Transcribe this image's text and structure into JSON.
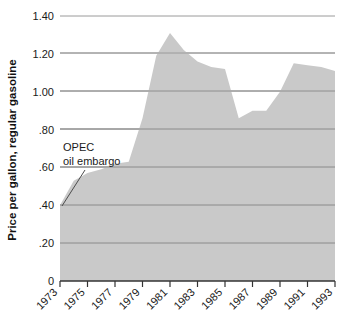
{
  "chart_data": {
    "type": "area",
    "title": "",
    "subtitle": "",
    "xlabel": "",
    "ylabel": "Price per gallon, regular gasoline",
    "xlim": [
      1973,
      1993
    ],
    "ylim": [
      0,
      1.4
    ],
    "grid": true,
    "legend": "none",
    "fill_color": "#c9c9c9",
    "grid_color": "#8c8c8c",
    "axis_color": "#333333",
    "x": [
      1973,
      1974,
      1975,
      1976,
      1977,
      1978,
      1979,
      1980,
      1981,
      1982,
      1983,
      1984,
      1985,
      1986,
      1987,
      1988,
      1989,
      1990,
      1991,
      1992,
      1993
    ],
    "values": [
      0.4,
      0.53,
      0.57,
      0.59,
      0.62,
      0.63,
      0.86,
      1.19,
      1.31,
      1.22,
      1.16,
      1.13,
      1.12,
      0.86,
      0.9,
      0.9,
      1.0,
      1.15,
      1.14,
      1.13,
      1.11
    ],
    "series": [
      {
        "name": "Price per gallon, regular gasoline",
        "values": [
          0.4,
          0.53,
          0.57,
          0.59,
          0.62,
          0.63,
          0.86,
          1.19,
          1.31,
          1.22,
          1.16,
          1.13,
          1.12,
          0.86,
          0.9,
          0.9,
          1.0,
          1.15,
          1.14,
          1.13,
          1.11
        ]
      }
    ],
    "ytick_labels": [
      "1.40",
      "1.20",
      "1.00",
      ".80",
      ".60",
      ".40",
      ".20",
      "0"
    ],
    "ytick_values": [
      1.4,
      1.2,
      1.0,
      0.8,
      0.6,
      0.4,
      0.2,
      0
    ],
    "xtick_labels": [
      "1973",
      "1975",
      "1977",
      "1979",
      "1981",
      "1983",
      "1985",
      "1987",
      "1989",
      "1991",
      "1993"
    ],
    "xtick_values": [
      1973,
      1975,
      1977,
      1979,
      1981,
      1983,
      1985,
      1987,
      1989,
      1991,
      1993
    ],
    "annotations": [
      {
        "line1": "OPEC",
        "line2": "oil embargo",
        "target_x": 1973,
        "target_y": 0.4
      }
    ]
  }
}
